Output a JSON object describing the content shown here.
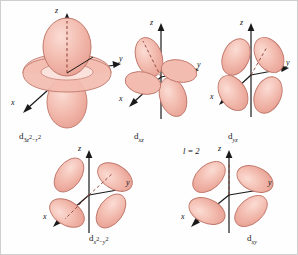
{
  "figure": {
    "title_annotation": "l = 2",
    "axis_labels": {
      "x": "x",
      "y": "y",
      "z": "z"
    },
    "lobe_fill": "#f2b5a8",
    "lobe_fill_light": "#f7d3cb",
    "lobe_stroke": "#b5655a",
    "axis_color": "#1a1a1a",
    "background": "#fefefe"
  },
  "orbitals": [
    {
      "id": "d3z2-r2",
      "label_main": "d",
      "label_sub_pre": "3",
      "label_sub_z": "z",
      "label_sub_zexp": "2",
      "label_sub_minus": "−",
      "label_sub_r": "r",
      "label_sub_rexp": "2",
      "label_plain": "d3z²−r²",
      "axes": [
        "z",
        "y",
        "x"
      ]
    },
    {
      "id": "dxz",
      "label_main": "d",
      "label_sub": "xz",
      "label_plain": "dxz",
      "axes": [
        "z",
        "y",
        "x"
      ]
    },
    {
      "id": "dyz",
      "label_main": "d",
      "label_sub": "yz",
      "label_plain": "dyz",
      "axes": [
        "z",
        "y",
        "x"
      ]
    },
    {
      "id": "dx2-y2",
      "label_main": "d",
      "label_sub_x": "x",
      "label_sub_xexp": "2",
      "label_sub_minus": "−",
      "label_sub_y": "y",
      "label_sub_yexp": "2",
      "label_plain": "dx²−y²",
      "axes": [
        "z",
        "y",
        "x"
      ]
    },
    {
      "id": "dxy",
      "label_main": "d",
      "label_sub": "xy",
      "label_plain": "dxy",
      "axes": [
        "z",
        "y",
        "x"
      ]
    }
  ]
}
